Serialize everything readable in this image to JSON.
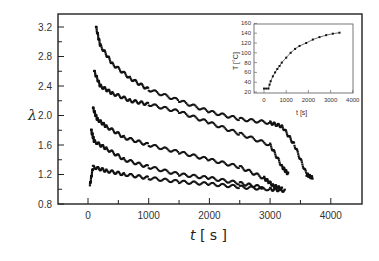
{
  "chart_data": [
    {
      "type": "scatter",
      "title": "",
      "xlabel": "t [s]",
      "ylabel": "λ",
      "xlim": [
        -500,
        4500
      ],
      "ylim": [
        0.8,
        3.4
      ],
      "xticks": [
        "0",
        "1000",
        "2000",
        "3000",
        "4000"
      ],
      "yticks": [
        "0.8",
        "1.2",
        "1.6",
        "2.0",
        "2.4",
        "2.8",
        "3.2"
      ],
      "grid": false,
      "series": [
        {
          "name": "series-1",
          "x": [
            130,
            200,
            400,
            700,
            1000,
            1500,
            2000,
            2500,
            3000,
            3200,
            3400,
            3600,
            3700
          ],
          "y": [
            3.2,
            2.95,
            2.7,
            2.5,
            2.35,
            2.2,
            2.05,
            1.95,
            1.9,
            1.85,
            1.6,
            1.2,
            1.15
          ]
        },
        {
          "name": "series-2",
          "x": [
            100,
            200,
            400,
            700,
            1000,
            1500,
            2000,
            2500,
            3000,
            3200,
            3300
          ],
          "y": [
            2.6,
            2.4,
            2.3,
            2.2,
            2.15,
            2.05,
            1.9,
            1.75,
            1.6,
            1.3,
            1.2
          ]
        },
        {
          "name": "series-3",
          "x": [
            80,
            150,
            300,
            600,
            1000,
            1500,
            2000,
            2500,
            2900,
            3050,
            3200
          ],
          "y": [
            2.1,
            1.95,
            1.85,
            1.7,
            1.6,
            1.5,
            1.4,
            1.3,
            1.15,
            1.05,
            1.0
          ]
        },
        {
          "name": "series-4",
          "x": [
            50,
            100,
            300,
            600,
            1000,
            1500,
            2000,
            2500,
            2900
          ],
          "y": [
            1.8,
            1.65,
            1.55,
            1.4,
            1.3,
            1.2,
            1.15,
            1.08,
            1.02
          ]
        },
        {
          "name": "series-5",
          "x": [
            30,
            80,
            300,
            600,
            1000,
            1500,
            2000,
            2500,
            3000,
            3250
          ],
          "y": [
            1.05,
            1.3,
            1.25,
            1.2,
            1.15,
            1.1,
            1.07,
            1.03,
            1.0,
            0.98
          ]
        }
      ]
    },
    {
      "type": "line",
      "title": "inset",
      "xlabel": "t [s]",
      "ylabel": "T [°C]",
      "xlim": [
        -300,
        4000
      ],
      "ylim": [
        15,
        160
      ],
      "xticks": [
        "0",
        "1000",
        "2000",
        "3000",
        "4000"
      ],
      "yticks": [
        "20",
        "40",
        "60",
        "80",
        "100",
        "120",
        "140",
        "160"
      ],
      "x": [
        0,
        100,
        200,
        250,
        300,
        400,
        500,
        600,
        700,
        800,
        1000,
        1200,
        1400,
        1600,
        1900,
        2200,
        2500,
        2800,
        3100,
        3400
      ],
      "y": [
        27,
        27,
        27,
        35,
        42,
        52,
        60,
        67,
        73,
        80,
        90,
        100,
        108,
        114,
        120,
        127,
        132,
        136,
        139,
        141
      ]
    }
  ]
}
